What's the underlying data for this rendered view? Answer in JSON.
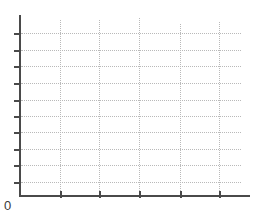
{
  "chart_data": {
    "type": "line",
    "title": "",
    "subtitle": "",
    "xlabel": "",
    "ylabel": "",
    "series": [],
    "categories": [],
    "x_tick_labels": [
      "",
      "",
      "",
      "",
      ""
    ],
    "y_tick_labels": [
      "",
      "",
      "",
      "",
      "",
      "",
      "",
      "",
      "",
      ""
    ],
    "origin_label": "0",
    "grid": {
      "visible": true,
      "style": "dotted",
      "color": "#b9b9b9",
      "horizontal_lines": 10,
      "vertical_lines": 5
    },
    "axes": {
      "color": "#4a4a4a",
      "x_axis_visible": true,
      "y_axis_visible": true,
      "x_tick_count": 5,
      "y_tick_count": 10
    },
    "legend": {
      "visible": false,
      "position": "none",
      "entries": []
    },
    "annotations": []
  },
  "canvas": {
    "width": 255,
    "height": 221,
    "background": "#ffffff"
  },
  "geometry": {
    "y_axis": {
      "x": 19,
      "top": 15,
      "bottom": 197
    },
    "x_axis": {
      "y": 195,
      "left": 19,
      "right": 250
    },
    "gridlines_h_y": [
      33,
      50,
      66,
      83,
      100,
      116,
      132,
      149,
      165,
      182
    ],
    "gridlines_h_left": 21,
    "gridlines_h_right": 241,
    "gridlines_v_x": [
      60,
      99,
      139,
      180,
      219
    ],
    "gridlines_v_top": [
      20,
      20,
      18,
      24,
      22
    ],
    "gridlines_v_bottom": 195,
    "ticks_y": [
      33,
      50,
      66,
      83,
      100,
      116,
      132,
      149,
      165,
      182
    ],
    "ticks_x": [
      60,
      99,
      139,
      180,
      219
    ]
  },
  "colors": {
    "axis": "#4a4a4a",
    "grid": "#b9b9b9",
    "label": "#3a3a3a",
    "background": "#ffffff"
  }
}
